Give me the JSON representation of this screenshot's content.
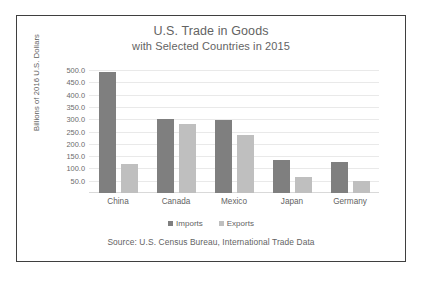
{
  "chart_data": {
    "type": "bar",
    "title": "U.S. Trade in Goods",
    "subtitle": "with Selected Countries in 2015",
    "xlabel": "",
    "ylabel": "Billions of 2016 U.S. Dollars",
    "categories": [
      "China",
      "Canada",
      "Mexico",
      "Japan",
      "Germany"
    ],
    "series": [
      {
        "name": "Imports",
        "color": "#7f7f7f",
        "values": [
          490.0,
          300.0,
          295.0,
          135.0,
          125.0
        ]
      },
      {
        "name": "Exports",
        "color": "#bfbfbf",
        "values": [
          118.0,
          280.0,
          235.0,
          65.0,
          50.0
        ]
      }
    ],
    "ylim": [
      0,
      500
    ],
    "ytick_labels": [
      "500.0",
      "450.0",
      "400.0",
      "350.0",
      "300.0",
      "250.0",
      "200.0",
      "150.0",
      "100.0",
      "50.0"
    ],
    "ytick_values": [
      500,
      450,
      400,
      350,
      300,
      250,
      200,
      150,
      100,
      50
    ],
    "grid": true,
    "legend_position": "bottom",
    "source_note": "Source: U.S. Census Bureau, International Trade Data"
  }
}
